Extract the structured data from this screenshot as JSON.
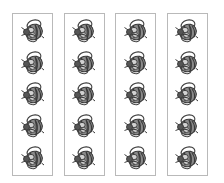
{
  "worksheet": {
    "panel_count": 4,
    "icons_per_panel": 5,
    "icon": "bee-icon",
    "colors": {
      "panel_border": "#b9b9b9",
      "bee_dark": "#555555",
      "bee_mid": "#8a8a8a",
      "bee_light": "#d2d2d2",
      "outline": "#3a3a3a",
      "background": "#ffffff"
    },
    "panels": [
      {
        "id": 1,
        "items": [
          "bee",
          "bee",
          "bee",
          "bee",
          "bee"
        ]
      },
      {
        "id": 2,
        "items": [
          "bee",
          "bee",
          "bee",
          "bee",
          "bee"
        ]
      },
      {
        "id": 3,
        "items": [
          "bee",
          "bee",
          "bee",
          "bee",
          "bee"
        ]
      },
      {
        "id": 4,
        "items": [
          "bee",
          "bee",
          "bee",
          "bee",
          "bee"
        ]
      }
    ]
  }
}
